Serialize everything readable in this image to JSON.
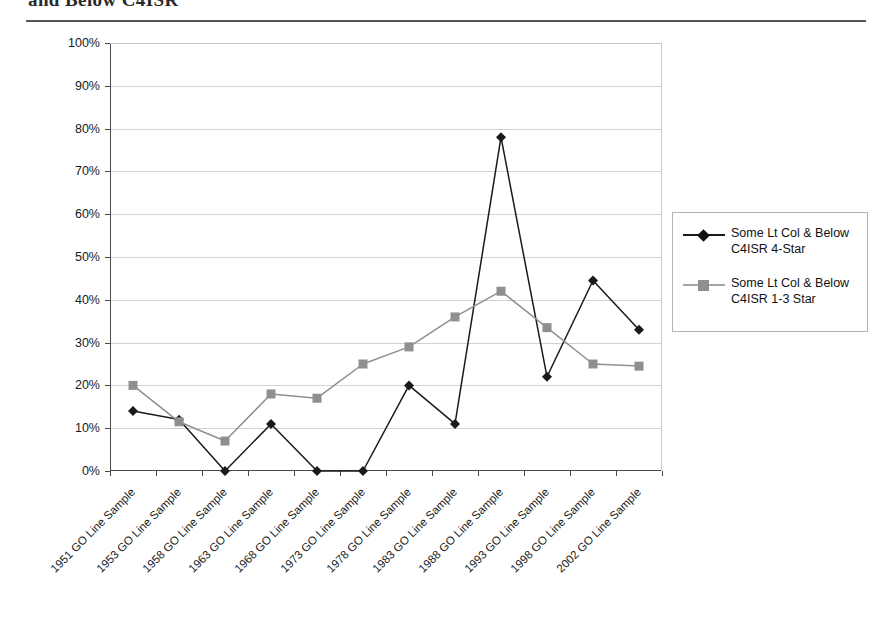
{
  "header": {
    "title": "and Below C4ISR",
    "rule": "horizontal-rule"
  },
  "chart_data": {
    "type": "line",
    "title": "",
    "xlabel": "",
    "ylabel": "",
    "ylim": [
      0,
      100
    ],
    "ytick_labels": [
      "100%",
      "90%",
      "80%",
      "70%",
      "60%",
      "50%",
      "40%",
      "30%",
      "20%",
      "10%",
      "0%"
    ],
    "ytick_values": [
      100,
      90,
      80,
      70,
      60,
      50,
      40,
      30,
      20,
      10,
      0
    ],
    "grid": true,
    "legend_position": "right",
    "categories": [
      "1951 GO Line Sample",
      "1953 GO Line Sample",
      "1958 GO Line Sample",
      "1963 GO Line Sample",
      "1968 GO Line Sample",
      "1973 GO Line Sample",
      "1978 GO Line Sample",
      "1983 GO Line Sample",
      "1988 GO Line Sample",
      "1993 GO Line Sample",
      "1998 GO Line Sample",
      "2002 GO Line Sample"
    ],
    "series": [
      {
        "name": "Some Lt Col & Below C4ISR  4-Star",
        "color": "#1a1a1a",
        "marker": "diamond",
        "values": [
          14,
          12,
          0,
          11,
          0,
          0,
          20,
          11,
          78,
          22,
          44.5,
          33
        ]
      },
      {
        "name": "Some Lt Col & Below C4ISR 1-3 Star",
        "color": "#8f8f8f",
        "marker": "square",
        "values": [
          20,
          11.5,
          7,
          18,
          17,
          25,
          29,
          36,
          42,
          33.5,
          25,
          24.5
        ]
      }
    ]
  },
  "legend": {
    "entries": [
      {
        "label": "Some Lt Col & Below C4ISR  4-Star",
        "color": "#1a1a1a",
        "marker": "diamond"
      },
      {
        "label": "Some Lt Col & Below C4ISR 1-3 Star",
        "color": "#8f8f8f",
        "marker": "square"
      }
    ]
  }
}
